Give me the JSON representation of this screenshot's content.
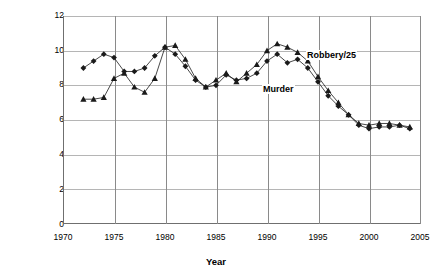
{
  "chart_data": {
    "type": "line",
    "title": "",
    "xlabel": "Year",
    "ylabel": "Rate per 100,000 Population",
    "xlim": [
      1970,
      2005
    ],
    "ylim": [
      0,
      12
    ],
    "xticks": [
      1970,
      1975,
      1980,
      1985,
      1990,
      1995,
      2000,
      2005
    ],
    "yticks": [
      0,
      2,
      4,
      6,
      8,
      10,
      12
    ],
    "grid": true,
    "legend": "inline-annotations",
    "x": [
      1972,
      1973,
      1974,
      1975,
      1976,
      1977,
      1978,
      1979,
      1980,
      1981,
      1982,
      1983,
      1984,
      1985,
      1986,
      1987,
      1988,
      1989,
      1990,
      1991,
      1992,
      1993,
      1994,
      1995,
      1996,
      1997,
      1998,
      1999,
      2000,
      2001,
      2002,
      2003,
      2004
    ],
    "series": [
      {
        "name": "Murder",
        "marker": "diamond",
        "values": [
          9.0,
          9.4,
          9.8,
          9.6,
          8.8,
          8.8,
          9.0,
          9.7,
          10.2,
          9.8,
          9.1,
          8.3,
          7.9,
          8.0,
          8.6,
          8.3,
          8.4,
          8.7,
          9.4,
          9.8,
          9.3,
          9.5,
          9.0,
          8.2,
          7.4,
          6.8,
          6.3,
          5.7,
          5.5,
          5.6,
          5.6,
          5.7,
          5.5
        ]
      },
      {
        "name": "Robbery/25",
        "marker": "triangle",
        "values": [
          7.2,
          7.2,
          7.3,
          8.4,
          8.7,
          7.9,
          7.6,
          8.4,
          10.2,
          10.3,
          9.5,
          8.4,
          7.9,
          8.3,
          8.7,
          8.2,
          8.7,
          9.2,
          10.0,
          10.4,
          10.2,
          9.9,
          9.4,
          8.5,
          7.7,
          7.0,
          6.3,
          5.8,
          5.7,
          5.8,
          5.8,
          5.7,
          5.6
        ]
      }
    ],
    "annotations": [
      {
        "text": "Robbery/25",
        "x": 1997.5,
        "y": 9.8
      },
      {
        "text": "Murder",
        "x": 1991.5,
        "y": 8.0
      }
    ]
  },
  "axis": {
    "y_tick_labels": [
      "12",
      "10",
      "8",
      "6",
      "4",
      "2",
      "0"
    ],
    "x_tick_labels": [
      "1970",
      "1975",
      "1980",
      "1985",
      "1990",
      "1995",
      "2000",
      "2005"
    ],
    "y_title": "Rate per 100,000 Population",
    "x_title": "Year"
  },
  "labels": {
    "robbery": "Robbery/25",
    "murder": "Murder"
  },
  "colors": {
    "marker": "#1a1a1a",
    "line": "#1a1a1a",
    "gridline": "#b5b5b5",
    "vgridline": "#8a8a8a",
    "axis": "#6f6f6f",
    "background": "#ffffff"
  }
}
